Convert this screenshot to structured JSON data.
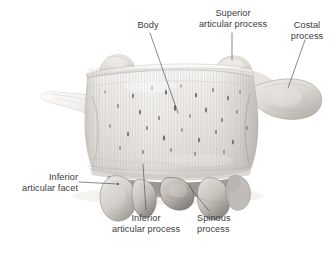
{
  "figure": {
    "view": "superior-anterior-oblique",
    "background_color": "#ffffff",
    "label_color": "#3c3c3e",
    "leader_color": "#55565a",
    "bone_light": "#f4f3f1",
    "bone_mid": "#dcd9d5",
    "bone_shadow": "#a6a29c",
    "bone_dark": "#6f6b67"
  },
  "labels": {
    "body": {
      "line1": "Body"
    },
    "superior_articular_process": {
      "line1": "Superior",
      "line2": "articular process"
    },
    "costal_process": {
      "line1": "Costal",
      "line2": "process"
    },
    "inferior_articular_facet": {
      "line1": "Inferior",
      "line2": "articular facet"
    },
    "inferior_articular_process": {
      "line1": "Inferior",
      "line2": "articular process"
    },
    "spinous_process": {
      "line1": "Spinous",
      "line2": "process"
    }
  }
}
